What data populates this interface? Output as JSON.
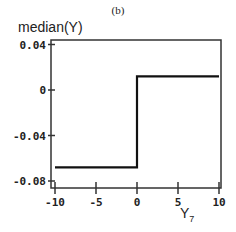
{
  "panel_label": "(b)",
  "chart_data": {
    "type": "line",
    "title": "(b)",
    "xlabel": "Y",
    "xlabel_subscript": "7",
    "ylabel": "median(Y)",
    "xlim": [
      -10,
      10
    ],
    "ylim": [
      -0.08,
      0.04
    ],
    "x_ticks": [
      -10,
      -5,
      0,
      5,
      10
    ],
    "x_tick_labels": [
      "-10",
      "-5",
      "0",
      "5",
      "10"
    ],
    "y_ticks": [
      0.04,
      0,
      -0.04,
      -0.08
    ],
    "y_tick_labels": [
      "0.04",
      "0",
      "-0.04",
      "-0.08"
    ],
    "grid": false,
    "legend": null,
    "series": [
      {
        "name": "median(Y)",
        "color": "#111111",
        "x": [
          -10,
          0,
          0,
          10
        ],
        "y": [
          -0.068,
          -0.068,
          0.012,
          0.012
        ]
      }
    ]
  }
}
